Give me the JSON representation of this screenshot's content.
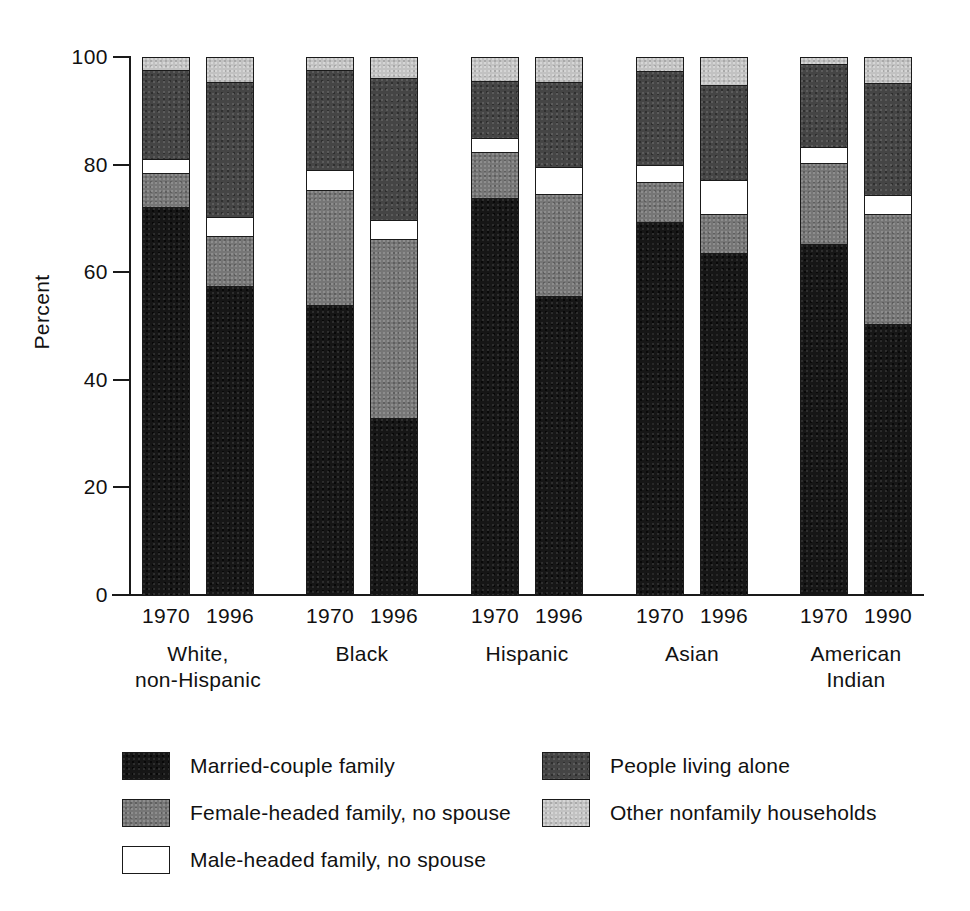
{
  "chart_data": {
    "type": "bar",
    "subtype": "stacked-bar-100",
    "title": "",
    "xlabel": "",
    "ylabel": "Percent",
    "ylim": [
      0,
      100
    ],
    "yticks": [
      0,
      20,
      40,
      60,
      80,
      100
    ],
    "grid": false,
    "legend_position": "bottom",
    "categories": [
      "White, non-Hispanic 1970",
      "White, non-Hispanic 1996",
      "Black 1970",
      "Black 1996",
      "Hispanic 1970",
      "Hispanic 1996",
      "Asian 1970",
      "Asian 1996",
      "American Indian 1970",
      "American Indian 1990"
    ],
    "series": [
      {
        "name": "Married-couple family",
        "color": "#161616",
        "values": [
          72.3,
          57.7,
          54.0,
          33.0,
          74.0,
          55.8,
          69.6,
          63.8,
          65.4,
          50.5
        ]
      },
      {
        "name": "Female-headed family, no spouse",
        "color": "#767676",
        "values": [
          6.4,
          9.3,
          21.4,
          33.3,
          8.5,
          19.0,
          7.4,
          7.2,
          15.1,
          20.5
        ]
      },
      {
        "name": "Male-headed family, no spouse",
        "color": "#ffffff",
        "values": [
          2.5,
          3.5,
          3.7,
          3.6,
          2.6,
          5.0,
          3.2,
          6.3,
          2.9,
          3.6
        ]
      },
      {
        "name": "People living alone",
        "color": "#454545",
        "values": [
          16.6,
          25.0,
          18.6,
          26.4,
          10.7,
          15.8,
          17.3,
          17.7,
          15.5,
          20.8
        ]
      },
      {
        "name": "Other nonfamily households",
        "color": "#c2c2c2",
        "values": [
          2.2,
          4.5,
          2.3,
          3.7,
          4.2,
          4.4,
          2.5,
          5.0,
          1.1,
          4.6
        ]
      }
    ]
  },
  "axes": {
    "y_title": "Percent",
    "y_tick_labels": [
      "100",
      "80",
      "60",
      "40",
      "20",
      "0"
    ]
  },
  "groups": [
    {
      "name": "White, non-Hispanic",
      "label_line1": "White,",
      "label_line2": "non-Hispanic",
      "years": [
        "1970",
        "1996"
      ]
    },
    {
      "name": "Black",
      "label_line1": "Black",
      "label_line2": "",
      "years": [
        "1970",
        "1996"
      ]
    },
    {
      "name": "Hispanic",
      "label_line1": "Hispanic",
      "label_line2": "",
      "years": [
        "1970",
        "1996"
      ]
    },
    {
      "name": "Asian",
      "label_line1": "Asian",
      "label_line2": "",
      "years": [
        "1970",
        "1996"
      ]
    },
    {
      "name": "American Indian",
      "label_line1": "American",
      "label_line2": "Indian",
      "years": [
        "1970",
        "1990"
      ]
    }
  ],
  "legend": {
    "left_column": [
      {
        "label": "Married-couple family",
        "key": "married",
        "color": "#161616"
      },
      {
        "label": "Female-headed family, no spouse",
        "key": "female",
        "color": "#767676"
      },
      {
        "label": "Male-headed family, no spouse",
        "key": "male",
        "color": "#ffffff"
      }
    ],
    "right_column": [
      {
        "label": "People living alone",
        "key": "alone",
        "color": "#454545"
      },
      {
        "label": "Other nonfamily households",
        "key": "other",
        "color": "#c2c2c2"
      }
    ]
  }
}
